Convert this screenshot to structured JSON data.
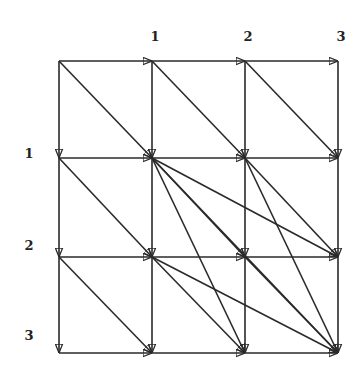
{
  "diagram": {
    "type": "directed-grid-graph",
    "grid": {
      "rows": 4,
      "cols": 4
    },
    "node_x": [
      59,
      152,
      245,
      338
    ],
    "node_y": [
      61,
      158,
      257,
      353
    ],
    "column_labels": [
      "",
      "1",
      "2",
      "3"
    ],
    "row_labels": [
      "",
      "1",
      "2",
      "3"
    ],
    "edge_color": "#2a2a2a",
    "edges": [
      [
        [
          0,
          0
        ],
        [
          0,
          1
        ]
      ],
      [
        [
          0,
          1
        ],
        [
          0,
          2
        ]
      ],
      [
        [
          0,
          2
        ],
        [
          0,
          3
        ]
      ],
      [
        [
          1,
          0
        ],
        [
          1,
          1
        ]
      ],
      [
        [
          1,
          1
        ],
        [
          1,
          2
        ]
      ],
      [
        [
          1,
          2
        ],
        [
          1,
          3
        ]
      ],
      [
        [
          2,
          0
        ],
        [
          2,
          1
        ]
      ],
      [
        [
          2,
          1
        ],
        [
          2,
          2
        ]
      ],
      [
        [
          2,
          2
        ],
        [
          2,
          3
        ]
      ],
      [
        [
          3,
          0
        ],
        [
          3,
          1
        ]
      ],
      [
        [
          3,
          1
        ],
        [
          3,
          2
        ]
      ],
      [
        [
          3,
          2
        ],
        [
          3,
          3
        ]
      ],
      [
        [
          0,
          0
        ],
        [
          1,
          0
        ]
      ],
      [
        [
          1,
          0
        ],
        [
          2,
          0
        ]
      ],
      [
        [
          2,
          0
        ],
        [
          3,
          0
        ]
      ],
      [
        [
          0,
          1
        ],
        [
          1,
          1
        ]
      ],
      [
        [
          1,
          1
        ],
        [
          2,
          1
        ]
      ],
      [
        [
          2,
          1
        ],
        [
          3,
          1
        ]
      ],
      [
        [
          0,
          2
        ],
        [
          1,
          2
        ]
      ],
      [
        [
          1,
          2
        ],
        [
          2,
          2
        ]
      ],
      [
        [
          2,
          2
        ],
        [
          3,
          2
        ]
      ],
      [
        [
          0,
          3
        ],
        [
          1,
          3
        ]
      ],
      [
        [
          1,
          3
        ],
        [
          2,
          3
        ]
      ],
      [
        [
          2,
          3
        ],
        [
          3,
          3
        ]
      ],
      [
        [
          0,
          0
        ],
        [
          1,
          1
        ]
      ],
      [
        [
          0,
          1
        ],
        [
          1,
          2
        ]
      ],
      [
        [
          0,
          2
        ],
        [
          1,
          3
        ]
      ],
      [
        [
          1,
          0
        ],
        [
          2,
          1
        ]
      ],
      [
        [
          2,
          0
        ],
        [
          3,
          1
        ]
      ],
      [
        [
          1,
          1
        ],
        [
          2,
          2
        ]
      ],
      [
        [
          1,
          1
        ],
        [
          2,
          3
        ]
      ],
      [
        [
          1,
          1
        ],
        [
          3,
          2
        ]
      ],
      [
        [
          1,
          1
        ],
        [
          3,
          3
        ]
      ],
      [
        [
          1,
          2
        ],
        [
          2,
          3
        ]
      ],
      [
        [
          1,
          2
        ],
        [
          3,
          3
        ]
      ],
      [
        [
          2,
          1
        ],
        [
          3,
          2
        ]
      ],
      [
        [
          2,
          1
        ],
        [
          3,
          3
        ]
      ],
      [
        [
          2,
          2
        ],
        [
          3,
          3
        ]
      ]
    ]
  }
}
